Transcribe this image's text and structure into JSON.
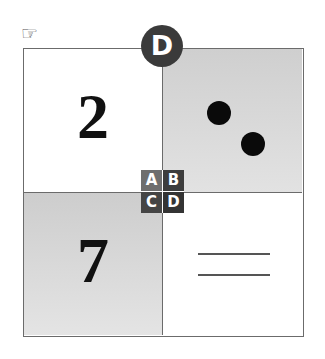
{
  "pointer": {
    "icon": "pointing-hand-icon",
    "glyph": "☞"
  },
  "badge": {
    "label": "D",
    "color": "#3a3a3a"
  },
  "quadrants": [
    {
      "id": "A",
      "content": "2",
      "type": "digit",
      "background": "#ffffff"
    },
    {
      "id": "B",
      "content": "two dots",
      "type": "dots",
      "count": 2,
      "background": "#d6d6d6"
    },
    {
      "id": "C",
      "content": "7",
      "type": "digit",
      "background": "#d6d6d6"
    },
    {
      "id": "D",
      "content": "two lines",
      "type": "lines",
      "count": 2,
      "background": "#ffffff"
    }
  ],
  "key": {
    "cells": [
      "A",
      "B",
      "C",
      "D"
    ]
  }
}
